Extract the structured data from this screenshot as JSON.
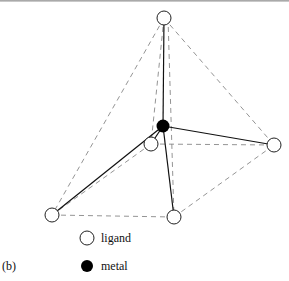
{
  "figure": {
    "panel_label": "(b)",
    "legend": [
      {
        "symbol": "open-circle",
        "label": "ligand"
      },
      {
        "symbol": "filled-circle",
        "label": "metal"
      }
    ],
    "nodes": {
      "metal": {
        "x": 163,
        "y": 126,
        "type": "metal"
      },
      "top": {
        "x": 164,
        "y": 18,
        "type": "ligand"
      },
      "back": {
        "x": 151,
        "y": 144,
        "type": "ligand"
      },
      "right": {
        "x": 274,
        "y": 145,
        "type": "ligand"
      },
      "bottom_left": {
        "x": 52,
        "y": 215,
        "type": "ligand"
      },
      "bottom_right": {
        "x": 174,
        "y": 217,
        "type": "ligand"
      }
    }
  }
}
